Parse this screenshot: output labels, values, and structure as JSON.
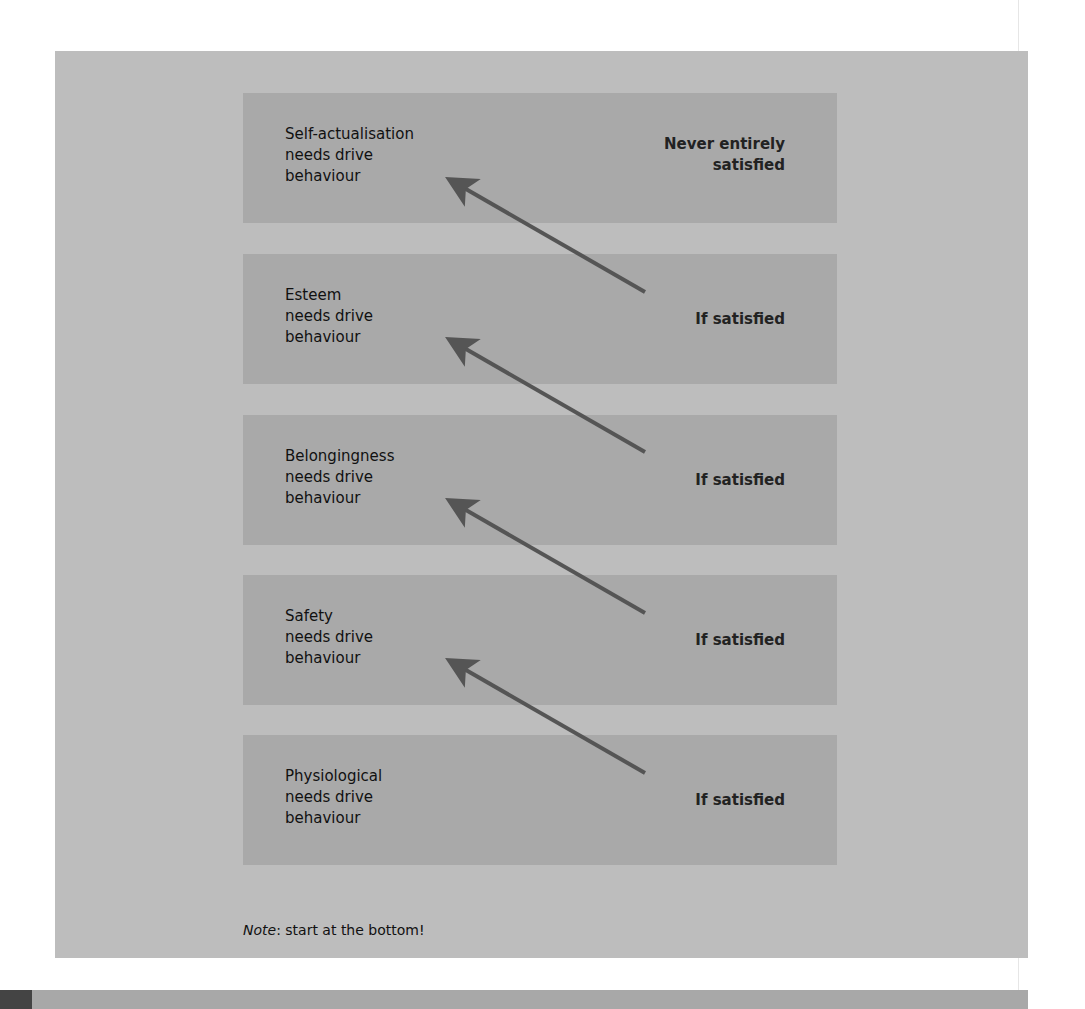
{
  "diagram": {
    "boxes": [
      {
        "label": "Self-actualisation\nneeds drive\nbehaviour",
        "status": "Never entirely\nsatisfied"
      },
      {
        "label": "Esteem\nneeds drive\nbehaviour",
        "status": "If satisfied"
      },
      {
        "label": "Belongingness\nneeds drive\nbehaviour",
        "status": "If satisfied"
      },
      {
        "label": "Safety\nneeds drive\nbehaviour",
        "status": "If satisfied"
      },
      {
        "label": "Physiological\nneeds drive\nbehaviour",
        "status": "If satisfied"
      }
    ],
    "note_prefix": "Note",
    "note_text": ": start at the bottom!"
  },
  "colors": {
    "panel": "#bdbdbd",
    "box": "#a9a9a9",
    "arrow": "#555555"
  }
}
